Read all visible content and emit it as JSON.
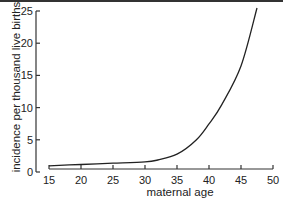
{
  "chart_data": {
    "type": "line",
    "title": "",
    "xlabel": "maternal age",
    "ylabel": "incidence per thousand live births",
    "xlim": [
      15,
      50
    ],
    "ylim": [
      0,
      25
    ],
    "x_ticks": [
      15,
      20,
      25,
      30,
      35,
      40,
      45,
      50
    ],
    "y_ticks": [
      0,
      5,
      10,
      15,
      20,
      25
    ],
    "grid": false,
    "legend": null,
    "series": [
      {
        "name": "incidence",
        "x": [
          15,
          20,
          25,
          30,
          32,
          35,
          38,
          40,
          42,
          45,
          47.5
        ],
        "values": [
          0.5,
          0.7,
          0.9,
          1.1,
          1.4,
          2.3,
          4.5,
          7.0,
          10.0,
          16.0,
          25.0
        ]
      }
    ]
  },
  "axes": {
    "xlabel": "maternal age",
    "ylabel": "incidence per thousand live births",
    "x_tick_labels": [
      "15",
      "20",
      "25",
      "30",
      "35",
      "40",
      "45",
      "50"
    ],
    "y_tick_labels": [
      "0",
      "5",
      "10",
      "15",
      "20",
      "25"
    ]
  }
}
